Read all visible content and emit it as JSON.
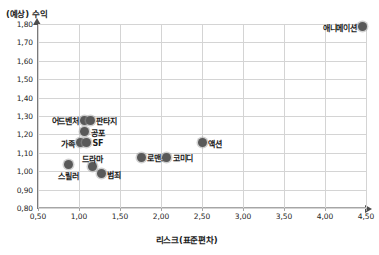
{
  "chart_data": {
    "type": "scatter",
    "title": "",
    "ylabel": "(예상) 수익",
    "xlabel": "리스크(표준편차)",
    "xlim": [
      0.5,
      4.5
    ],
    "ylim": [
      0.8,
      1.8
    ],
    "xticks": [
      "0,50",
      "1,00",
      "1,50",
      "2,00",
      "2,50",
      "3,00",
      "3,50",
      "4,00",
      "4,50"
    ],
    "xtick_values": [
      0.5,
      1.0,
      1.5,
      2.0,
      2.5,
      3.0,
      3.5,
      4.0,
      4.5
    ],
    "yticks": [
      "0,80",
      "0,90",
      "1,00",
      "1,10",
      "1,20",
      "1,30",
      "1,40",
      "1,50",
      "1,60",
      "1,70",
      "1,80"
    ],
    "ytick_values": [
      0.8,
      0.9,
      1.0,
      1.1,
      1.2,
      1.3,
      1.4,
      1.5,
      1.6,
      1.7,
      1.8
    ],
    "grid": true,
    "legend": "none",
    "marker_color": "#595959",
    "points": [
      {
        "label": "애니메이션",
        "x": 4.46,
        "y": 1.785,
        "label_pos": "left"
      },
      {
        "label": "어드벤처",
        "x": 1.07,
        "y": 1.277,
        "label_pos": "left"
      },
      {
        "label": "판타지",
        "x": 1.14,
        "y": 1.277,
        "label_pos": "right"
      },
      {
        "label": "공포",
        "x": 1.07,
        "y": 1.215,
        "label_pos": "right"
      },
      {
        "label": "가족",
        "x": 1.02,
        "y": 1.155,
        "label_pos": "left"
      },
      {
        "label": "SF",
        "x": 1.09,
        "y": 1.155,
        "label_pos": "right"
      },
      {
        "label": "액션",
        "x": 2.5,
        "y": 1.155,
        "label_pos": "right"
      },
      {
        "label": "로맨스",
        "x": 1.76,
        "y": 1.075,
        "label_pos": "right"
      },
      {
        "label": "코미디",
        "x": 2.07,
        "y": 1.075,
        "label_pos": "right"
      },
      {
        "label": "드라마",
        "x": 1.16,
        "y": 1.025,
        "label_pos": "above"
      },
      {
        "label": "스릴러",
        "x": 0.87,
        "y": 1.035,
        "label_pos": "below"
      },
      {
        "label": "범죄",
        "x": 1.27,
        "y": 0.985,
        "label_pos": "right"
      }
    ]
  }
}
